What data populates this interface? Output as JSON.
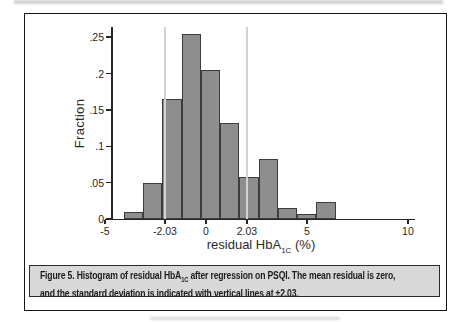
{
  "figure": {
    "caption": {
      "line1_prefix": "Figure 5. Histogram of residual HbA",
      "line1_subscript": "1C",
      "line1_suffix": " after regression on PSQI. The mean residual is zero,",
      "line2": "and the standard deviation is indicated with vertical lines at ±2.03."
    }
  },
  "chart_data": {
    "type": "bar",
    "subtype": "histogram",
    "title": "",
    "ylabel": "Fraction",
    "xlabel_prefix": "residual HbA",
    "xlabel_subscript": "1C",
    "xlabel_suffix": " (%)",
    "xlim": [
      -5.1,
      10.25
    ],
    "ylim": [
      0,
      0.264
    ],
    "grid": false,
    "legend": "none",
    "bins": {
      "start": -4.06,
      "width": 0.953
    },
    "values": [
      0.01,
      0.05,
      0.165,
      0.255,
      0.205,
      0.132,
      0.058,
      0.082,
      0.015,
      0.007,
      0.024
    ],
    "x_ticks": {
      "values": [
        -5,
        -2.03,
        0,
        2.03,
        5,
        10
      ],
      "labels": [
        "-5",
        "-2.03",
        "0",
        "2.03",
        "5",
        "10"
      ]
    },
    "y_ticks": {
      "values": [
        0,
        0.05,
        0.1,
        0.15,
        0.2,
        0.25
      ],
      "labels": [
        "0",
        ".05",
        ".1",
        ".15",
        ".2",
        ".25"
      ]
    },
    "ref_lines": {
      "positions": [
        -2.03,
        2.03
      ],
      "color": "#d2d2d2"
    },
    "colors": {
      "bar_fill": "#8e8e8e",
      "bar_border": "#3d3d3d",
      "axis": "#262626"
    }
  }
}
